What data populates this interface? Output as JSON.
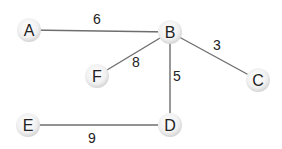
{
  "graph": {
    "nodes": [
      {
        "id": "A",
        "label": "A",
        "x": 29,
        "y": 30
      },
      {
        "id": "B",
        "label": "B",
        "x": 170,
        "y": 32
      },
      {
        "id": "C",
        "label": "C",
        "x": 258,
        "y": 80
      },
      {
        "id": "D",
        "label": "D",
        "x": 170,
        "y": 125
      },
      {
        "id": "E",
        "label": "E",
        "x": 28,
        "y": 125
      },
      {
        "id": "F",
        "label": "F",
        "x": 97,
        "y": 76
      }
    ],
    "edges": [
      {
        "from": "A",
        "to": "B",
        "weight": "6",
        "lx": 97,
        "ly": 24
      },
      {
        "from": "B",
        "to": "F",
        "weight": "8",
        "lx": 136,
        "ly": 67
      },
      {
        "from": "B",
        "to": "C",
        "weight": "3",
        "lx": 217,
        "ly": 50
      },
      {
        "from": "B",
        "to": "D",
        "weight": "5",
        "lx": 177,
        "ly": 81
      },
      {
        "from": "E",
        "to": "D",
        "weight": "9",
        "lx": 92,
        "ly": 143
      }
    ]
  },
  "colors": {
    "edge": "#6e6e6e",
    "node_fill_center": "#ffffff",
    "node_fill_edge": "#d9d9d9",
    "text": "#222222"
  }
}
